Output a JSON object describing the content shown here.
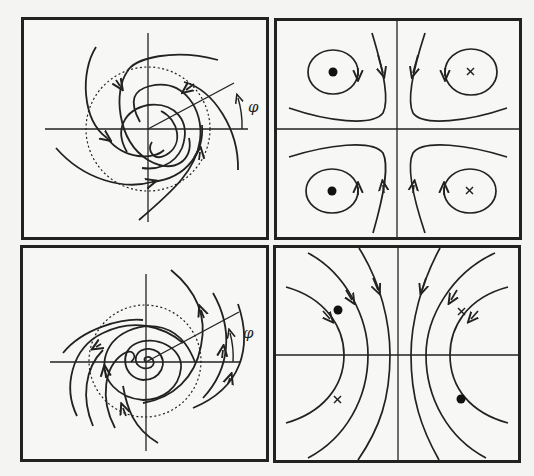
{
  "figure": {
    "panels": [
      {
        "id": "top-left",
        "description": "Trailing spiral streamlines around origin with dashed circle and angle phi",
        "label": "φ"
      },
      {
        "id": "top-right",
        "description": "Four closed orbits around point vortices with saddle-like hyperbolic streamlines near axes",
        "markers": [
          "dot",
          "cross",
          "dot",
          "cross"
        ]
      },
      {
        "id": "bottom-left",
        "description": "Leading spiral streamlines winding into center with dashed circle and angle phi",
        "label": "φ"
      },
      {
        "id": "bottom-right",
        "description": "Hyperbolic streamlines opening left and right, with dot and cross markers",
        "markers": [
          "dot",
          "cross",
          "cross",
          "dot"
        ]
      }
    ]
  },
  "colors": {
    "stroke": "#222222",
    "background": "#f7f7f5"
  }
}
